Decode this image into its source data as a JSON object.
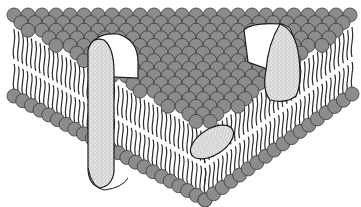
{
  "diagram": {
    "colors": {
      "head_fill": "#8c8c8c",
      "head_stroke": "#3a3a3a",
      "tail_stroke": "#2a2a2a",
      "protein_fill": "#d9d9d9",
      "protein_stroke": "#1a1a1a",
      "cut_face": "#ffffff"
    },
    "components": [
      {
        "id": "top-leaflet-heads",
        "type": "phospholipid-head-grid"
      },
      {
        "id": "left-front-face",
        "type": "bilayer-cross-section"
      },
      {
        "id": "right-front-face",
        "type": "bilayer-cross-section"
      },
      {
        "id": "transmembrane-protein-left",
        "type": "integral-protein"
      },
      {
        "id": "transmembrane-protein-right",
        "type": "integral-protein"
      },
      {
        "id": "embedded-protein-bottom",
        "type": "peripheral-embedded-protein"
      }
    ]
  }
}
